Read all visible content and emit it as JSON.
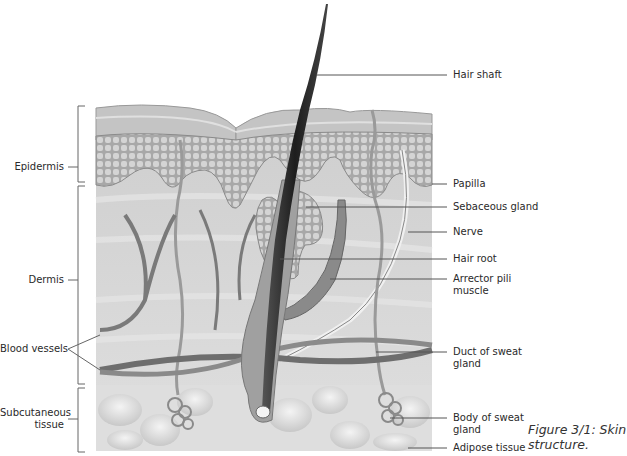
{
  "figure": {
    "caption": "Figure 3/1: Skin structure.",
    "caption_line1": "Figure 3/1: Skin",
    "caption_line2": "structure."
  },
  "left_labels": {
    "epidermis": "Epidermis",
    "dermis": "Dermis",
    "blood_vessels": "Blood vessels",
    "subcutaneous_line1": "Subcutaneous",
    "subcutaneous_line2": "tissue"
  },
  "right_labels": {
    "hair_shaft": "Hair shaft",
    "papilla": "Papilla",
    "sebaceous_gland": "Sebaceous gland",
    "nerve": "Nerve",
    "hair_root": "Hair root",
    "arrector_pili_line1": "Arrector pili",
    "arrector_pili_line2": "muscle",
    "duct_line1": "Duct of sweat",
    "duct_line2": "gland",
    "body_line1": "Body of sweat",
    "body_line2": "gland",
    "adipose_tissue": "Adipose tissue"
  },
  "colors": {
    "background": "#ffffff",
    "epidermis": "#c8c8c8",
    "dermis": "#d6d6d6",
    "subcutaneous": "#e2e2e2",
    "hair": "#3a3a3a",
    "leader_lines": "#555555"
  }
}
